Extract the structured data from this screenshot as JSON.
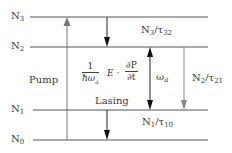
{
  "levels": [
    {
      "id": "N3",
      "label": "N",
      "sub": "3"
    },
    {
      "id": "N2",
      "label": "N",
      "sub": "2"
    },
    {
      "id": "N1",
      "label": "N",
      "sub": "1"
    },
    {
      "id": "N0",
      "label": "N",
      "sub": "0"
    }
  ],
  "transitions": {
    "n3_n2": {
      "label": "N",
      "sub1": "3",
      "slash": "/τ",
      "sub2": "32"
    },
    "n2_n1": {
      "label": "N",
      "sub1": "2",
      "slash": "/τ",
      "sub2": "21"
    },
    "n1_n0": {
      "label": "N",
      "sub1": "1",
      "slash": "/τ",
      "sub2": "10"
    }
  },
  "pump_label": "Pump",
  "lasing_label": "Lasing",
  "omega_label": {
    "main": "ω",
    "sub": "a"
  },
  "formula": {
    "frac1_num": "1",
    "frac1_den_main": "ħω",
    "frac1_den_sub": "a",
    "middle": "E ·",
    "frac2_num": "∂P",
    "frac2_den": "∂t"
  },
  "colors": {
    "line": "#555555",
    "pump_arrow": "#777777",
    "black_arrow": "#111111",
    "gray_arrow": "#888888"
  }
}
